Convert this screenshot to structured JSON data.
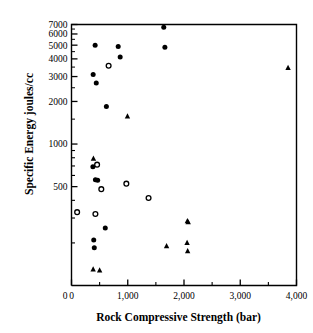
{
  "chart_data": {
    "type": "scatter",
    "title": "",
    "xlabel": "Rock Compressive Strength (bar)",
    "ylabel": "Specific Energy joules/cc",
    "xlim": [
      0,
      4000
    ],
    "ylim": [
      100,
      7000
    ],
    "yscale": "log",
    "xscale": "linear",
    "grid": false,
    "legend": "none",
    "xticks": [
      0,
      1000,
      2000,
      3000,
      4000
    ],
    "xticklabels": [
      "0",
      "1,000",
      "2,000",
      "3,000",
      "4,000"
    ],
    "xminorticks": [
      500,
      1500,
      2500,
      3500
    ],
    "yticks": [
      500,
      1000,
      2000,
      3000,
      4000,
      5000,
      6000,
      7000
    ],
    "yticklabels": [
      "500",
      "1000",
      "2000",
      "3000",
      "4000",
      "5000",
      "6000",
      "7000"
    ],
    "yminorticks": [
      200,
      300,
      400,
      600,
      700,
      800,
      900
    ],
    "series": [
      {
        "name": "filled-circle",
        "marker": "filled-circle",
        "color": "#000000",
        "points": [
          [
            1640,
            6700
          ],
          [
            420,
            5000
          ],
          [
            830,
            4900
          ],
          [
            1660,
            4830
          ],
          [
            865,
            4120
          ],
          [
            385,
            3100
          ],
          [
            440,
            2700
          ],
          [
            620,
            1840
          ],
          [
            380,
            690
          ],
          [
            425,
            560
          ],
          [
            465,
            555
          ],
          [
            395,
            210
          ],
          [
            405,
            185
          ],
          [
            600,
            255
          ]
        ]
      },
      {
        "name": "open-circle",
        "marker": "open-circle",
        "color": "#000000",
        "points": [
          [
            660,
            3580
          ],
          [
            455,
            715
          ],
          [
            530,
            480
          ],
          [
            975,
            525
          ],
          [
            1370,
            415
          ],
          [
            100,
            330
          ],
          [
            425,
            320
          ]
        ]
      },
      {
        "name": "filled-triangle",
        "marker": "filled-triangle",
        "color": "#000000",
        "points": [
          [
            3850,
            3450
          ],
          [
            995,
            1570
          ],
          [
            390,
            790
          ],
          [
            2060,
            285
          ],
          [
            2075,
            280
          ],
          [
            2055,
            200
          ],
          [
            2065,
            175
          ],
          [
            1690,
            190
          ],
          [
            385,
            130
          ],
          [
            500,
            128
          ]
        ]
      }
    ]
  }
}
